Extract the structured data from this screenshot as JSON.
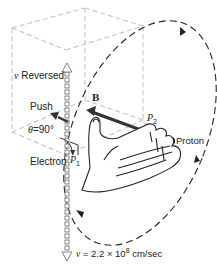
{
  "diagram": {
    "labels": {
      "v_reversed_symbol": "v",
      "v_reversed_text": " Reversed",
      "push": "Push",
      "theta": "θ",
      "theta_value": "=90°",
      "electron": "Electron",
      "p1_symbol": "P",
      "p1_sub": "1",
      "field": "B",
      "p2_symbol": "P",
      "p2_sub": "2",
      "proton": "Proton",
      "velocity_symbol": "v",
      "velocity_eq": " = 2.2 × 10",
      "velocity_exp": "8",
      "velocity_unit": " cm/sec"
    },
    "colors": {
      "cube": "#c8c8c8",
      "orbit": "#222222",
      "arrow": "#333333",
      "text": "#222222"
    }
  }
}
